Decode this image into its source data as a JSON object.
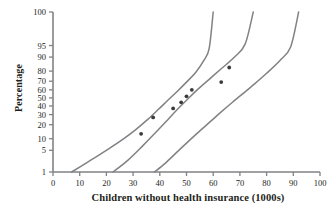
{
  "chart_data": {
    "type": "scatter",
    "title": "",
    "subtitle": "",
    "xlabel": "Children without health insurance (1000s)",
    "ylabel": "Percentage",
    "xlim": [
      0,
      100
    ],
    "ylim": [
      1,
      100
    ],
    "yscale": "probability",
    "grid": false,
    "legend": null,
    "xticks": [
      0,
      10,
      20,
      30,
      40,
      50,
      60,
      70,
      80,
      90,
      100
    ],
    "xtick_labels": [
      "0",
      "10",
      "20",
      "30",
      "40",
      "50",
      "60",
      "70",
      "80",
      "90",
      "100"
    ],
    "yticks": [
      1,
      5,
      10,
      20,
      30,
      40,
      50,
      60,
      70,
      80,
      90,
      95,
      100
    ],
    "ytick_labels": [
      "1",
      "5",
      "10",
      "20",
      "30",
      "40",
      "50",
      "60",
      "70",
      "80",
      "90",
      "95",
      "100"
    ],
    "axis_color": "#808285",
    "curve_color": "#808285",
    "point_color": "#3b3b3b",
    "points": [
      {
        "x": 33.0,
        "y": 13.0
      },
      {
        "x": 37.5,
        "y": 27.0
      },
      {
        "x": 45.0,
        "y": 37.0
      },
      {
        "x": 48.0,
        "y": 44.5
      },
      {
        "x": 50.0,
        "y": 52.0
      },
      {
        "x": 52.0,
        "y": 60.0
      },
      {
        "x": 63.0,
        "y": 69.0
      },
      {
        "x": 66.0,
        "y": 83.0
      }
    ],
    "series": [
      {
        "name": "upper-confidence-band",
        "points": [
          {
            "x": 7.0,
            "y": 1.0
          },
          {
            "x": 13.0,
            "y": 2.2
          },
          {
            "x": 20.0,
            "y": 5.0
          },
          {
            "x": 26.0,
            "y": 9.5
          },
          {
            "x": 31.0,
            "y": 16.0
          },
          {
            "x": 35.5,
            "y": 25.0
          },
          {
            "x": 39.5,
            "y": 36.0
          },
          {
            "x": 43.0,
            "y": 47.0
          },
          {
            "x": 46.5,
            "y": 58.0
          },
          {
            "x": 50.0,
            "y": 69.0
          },
          {
            "x": 53.5,
            "y": 79.0
          },
          {
            "x": 56.5,
            "y": 88.0
          },
          {
            "x": 58.5,
            "y": 94.0
          },
          {
            "x": 60.0,
            "y": 100.0
          }
        ]
      },
      {
        "name": "fitted-curve",
        "points": [
          {
            "x": 22.5,
            "y": 1.0
          },
          {
            "x": 28.0,
            "y": 2.5
          },
          {
            "x": 33.5,
            "y": 6.5
          },
          {
            "x": 38.0,
            "y": 13.0
          },
          {
            "x": 42.0,
            "y": 22.0
          },
          {
            "x": 46.0,
            "y": 34.0
          },
          {
            "x": 50.0,
            "y": 47.0
          },
          {
            "x": 54.0,
            "y": 60.0
          },
          {
            "x": 58.5,
            "y": 72.0
          },
          {
            "x": 63.0,
            "y": 82.0
          },
          {
            "x": 68.0,
            "y": 90.0
          },
          {
            "x": 72.0,
            "y": 95.5
          },
          {
            "x": 75.0,
            "y": 100.0
          }
        ]
      },
      {
        "name": "lower-confidence-band",
        "points": [
          {
            "x": 38.0,
            "y": 1.0
          },
          {
            "x": 42.0,
            "y": 2.0
          },
          {
            "x": 46.5,
            "y": 4.5
          },
          {
            "x": 51.0,
            "y": 9.0
          },
          {
            "x": 55.0,
            "y": 15.0
          },
          {
            "x": 59.0,
            "y": 23.0
          },
          {
            "x": 63.0,
            "y": 33.0
          },
          {
            "x": 67.0,
            "y": 44.0
          },
          {
            "x": 71.0,
            "y": 55.0
          },
          {
            "x": 75.5,
            "y": 67.0
          },
          {
            "x": 80.0,
            "y": 78.0
          },
          {
            "x": 85.0,
            "y": 88.0
          },
          {
            "x": 89.0,
            "y": 94.5
          },
          {
            "x": 92.0,
            "y": 100.0
          }
        ]
      }
    ]
  }
}
